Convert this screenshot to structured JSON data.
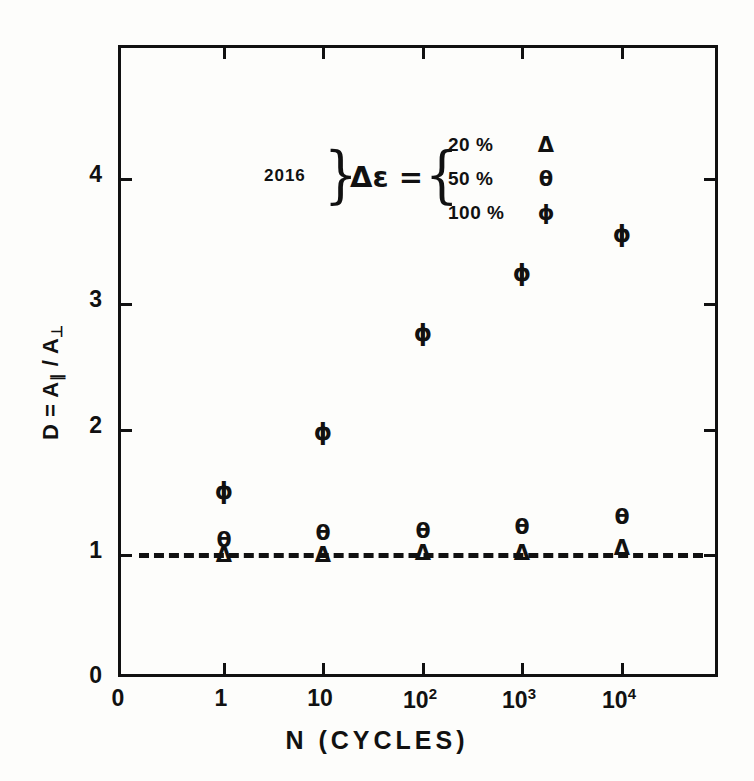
{
  "chart_data": {
    "type": "scatter",
    "title": "",
    "xlabel": "N   (CYCLES)",
    "ylabel": "D = A∥ / A⊥",
    "x_tick_labels": [
      "0",
      "1",
      "10",
      "10²",
      "10³",
      "10⁴"
    ],
    "x_tick_bases": [
      "0",
      "1",
      "10",
      "10",
      "10",
      "10"
    ],
    "x_tick_exps": [
      "",
      "",
      "",
      "2",
      "3",
      "4"
    ],
    "y_tick_labels": [
      "0",
      "1",
      "2",
      "3",
      "4"
    ],
    "y_values": [
      0,
      1,
      2,
      3,
      4
    ],
    "ylim": [
      0,
      5.04
    ],
    "x_categories": [
      "1",
      "10",
      "10²",
      "10³",
      "10⁴"
    ],
    "grid": false,
    "legend_position": "upper-left-inside",
    "reference_line": {
      "y": 1,
      "style": "dashed",
      "label": "D = 1"
    },
    "series": [
      {
        "name": "Δε = 20 %",
        "marker": "Δ",
        "marker_name": "triangle-open",
        "x": [
          "1",
          "10",
          "10²",
          "10³",
          "10⁴"
        ],
        "values": [
          1.0,
          1.0,
          1.01,
          1.01,
          1.05
        ],
        "errors": [
          0,
          0,
          0,
          0,
          0
        ]
      },
      {
        "name": "Δε = 50 %",
        "marker": "θ",
        "marker_name": "theta",
        "x": [
          "1",
          "10",
          "10²",
          "10³",
          "10⁴"
        ],
        "values": [
          1.12,
          1.17,
          1.19,
          1.22,
          1.3
        ],
        "errors": [
          0,
          0,
          0,
          0,
          0
        ]
      },
      {
        "name": "Δε = 100 %",
        "marker": "ϕ",
        "marker_name": "phi",
        "x": [
          "1",
          "10",
          "10²",
          "10³",
          "10⁴"
        ],
        "values": [
          1.51,
          1.98,
          2.77,
          3.25,
          3.56
        ],
        "errors": [
          0.05,
          0.05,
          0.05,
          0.05,
          0.05
        ]
      }
    ]
  },
  "legend": {
    "sample_label": "2016",
    "equation": "Δε =",
    "rows": [
      {
        "value": "20 %",
        "symbol": "Δ"
      },
      {
        "value": "50 %",
        "symbol": "θ"
      },
      {
        "value": "100 %",
        "symbol": "ϕ"
      }
    ]
  },
  "axis": {
    "ylabel_head": "D = A",
    "ylabel_sub1": "∥",
    "ylabel_mid": " / A",
    "ylabel_sub2": "⊥",
    "xlabel": "N    (CYCLES)",
    "origin_label": "0"
  }
}
